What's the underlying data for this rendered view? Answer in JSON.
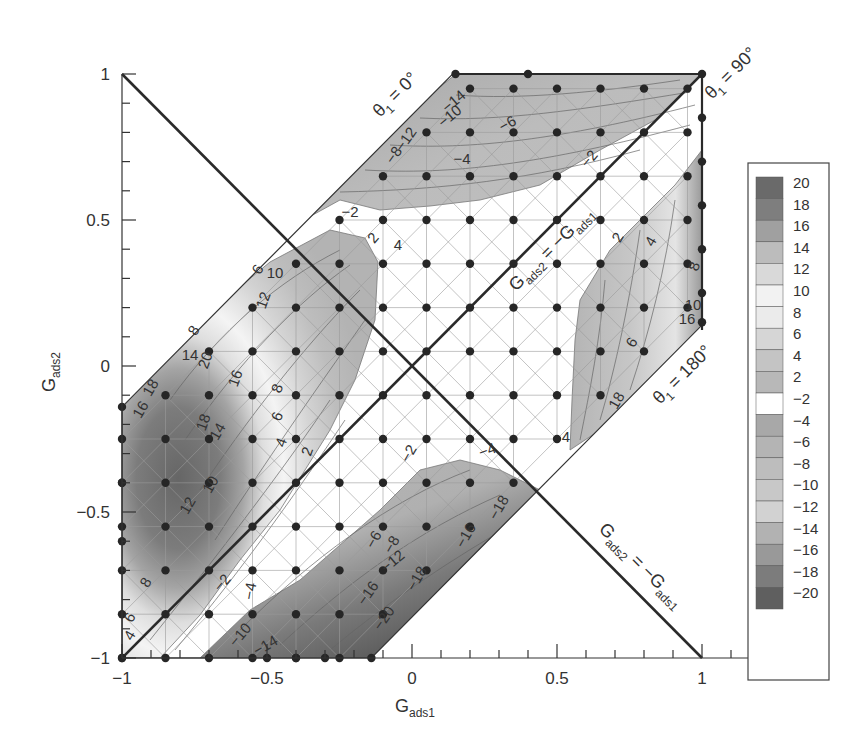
{
  "chart_data": {
    "type": "heatmap",
    "subtype": "filled-contour over triangulated mesh",
    "title": "",
    "xlabel": "G_ads1",
    "ylabel": "G_ads2",
    "xlim": [
      -1,
      1.23
    ],
    "ylim": [
      -1,
      1
    ],
    "xticks": [
      -1,
      -0.5,
      0,
      0.5,
      1
    ],
    "xtick_labels": [
      "−1",
      "−0.5",
      "0",
      "0.5",
      "1"
    ],
    "yticks": [
      -1,
      -0.5,
      0,
      0.5,
      1
    ],
    "ytick_labels": [
      "−1",
      "−0.5",
      "0",
      "0.5",
      "1"
    ],
    "minor_tick_step": 0.1,
    "grid": false,
    "domain_region": {
      "description": "hexagonal band between lines G_ads2 = G_ads1 + 0.86 and G_ads2 = G_ads1 − 0.86 inside the unit box",
      "vertices": [
        [
          -1,
          -1
        ],
        [
          -0.14,
          -1
        ],
        [
          1,
          0.14
        ],
        [
          1,
          1
        ],
        [
          0.14,
          1
        ],
        [
          -1,
          -0.14
        ]
      ]
    },
    "reference_lines": [
      {
        "label": "G_ads2 = −G_ads1",
        "from": [
          -1,
          1
        ],
        "to": [
          1,
          -1
        ],
        "label_pos": "lower-right"
      },
      {
        "label": "G_ads2 = −G_ads1",
        "from": [
          -1,
          -1
        ],
        "to": [
          1,
          1
        ],
        "label_pos": "center-right"
      }
    ],
    "boundary_labels": [
      {
        "text": "θ1 = 0°",
        "edge": "upper-left diagonal"
      },
      {
        "text": "θ1 = 90°",
        "edge": "top-right corner"
      },
      {
        "text": "θ1 = 180°",
        "edge": "lower-right diagonal"
      }
    ],
    "colorbar": {
      "position": "right",
      "levels": [
        20,
        18,
        16,
        14,
        12,
        10,
        8,
        6,
        4,
        2,
        -2,
        -4,
        -6,
        -8,
        -10,
        -12,
        -14,
        -16,
        -18,
        -20
      ],
      "labels": [
        "20",
        "18",
        "16",
        "14",
        "12",
        "10",
        "8",
        "6",
        "4",
        "2",
        "−2",
        "−4",
        "−6",
        "−8",
        "−10",
        "−12",
        "−14",
        "−16",
        "−18",
        "−20"
      ],
      "colors": [
        "#6a6a6a",
        "#7e7e7e",
        "#a0a0a0",
        "#bcbcbc",
        "#d9d9d9",
        "#f2f2f2",
        "#ebebeb",
        "#d6d6d6",
        "#c4c4c4",
        "#b8b8b8",
        "#ffffff",
        "#a8a8a8",
        "#b4b4b4",
        "#bdbdbd",
        "#c8c8c8",
        "#d2d2d2",
        "#b2b2b2",
        "#999999",
        "#7c7c7c",
        "#5f5f5f"
      ]
    },
    "regions": [
      {
        "name": "upper negative lobe",
        "range": [
          -14,
          -2
        ],
        "contour_labels": [
          "-14",
          "-10",
          "-12",
          "-8",
          "-6",
          "-4",
          "-2"
        ]
      },
      {
        "name": "left positive lobe",
        "range": [
          2,
          20
        ],
        "contour_labels": [
          "4",
          "6",
          "10",
          "12",
          "8",
          "14",
          "20",
          "18",
          "16",
          "18",
          "14",
          "12",
          "10",
          "8",
          "6",
          "4",
          "2"
        ]
      },
      {
        "name": "right positive lobe",
        "range": [
          2,
          16
        ],
        "contour_labels": [
          "2",
          "4",
          "8",
          "10",
          "16",
          "6",
          "18",
          "4"
        ]
      },
      {
        "name": "lower negative lobe",
        "range": [
          -20,
          -2
        ],
        "contour_labels": [
          "-2",
          "-4",
          "-6",
          "-8",
          "-12",
          "-16",
          "-18",
          "-20",
          "-10",
          "-14"
        ]
      },
      {
        "name": "central neutral band",
        "range": [
          -2,
          2
        ]
      }
    ],
    "sample_points_grid_step": 0.15
  },
  "axes": {
    "xlabel_main": "G",
    "xlabel_sub": "ads1",
    "ylabel_main": "G",
    "ylabel_sub": "ads2"
  },
  "annotations": {
    "theta0": {
      "main": "θ",
      "sub": "1",
      "rest": " = 0°"
    },
    "theta90": {
      "main": "θ",
      "sub": "1",
      "rest": " = 90°"
    },
    "theta180": {
      "main": "θ",
      "sub": "1",
      "rest": " = 180°"
    },
    "diag_center": {
      "g1": "G",
      "s1": "ads2",
      "eq": " = −G",
      "s2": "ads1"
    },
    "diag_lower": {
      "g1": "G",
      "s1": "ads2",
      "eq": " = −G",
      "s2": "ads1"
    }
  },
  "contour_text": {
    "upper": [
      {
        "t": "-14",
        "x": 457,
        "y": 105,
        "r": -40
      },
      {
        "t": "-10",
        "x": 453,
        "y": 120,
        "r": -40
      },
      {
        "t": "-12",
        "x": 410,
        "y": 142,
        "r": -55
      },
      {
        "t": "-8",
        "x": 398,
        "y": 158,
        "r": -55
      },
      {
        "t": "-6",
        "x": 510,
        "y": 128,
        "r": -30
      },
      {
        "t": "-4",
        "x": 462,
        "y": 164,
        "r": 0
      },
      {
        "t": "-2",
        "x": 593,
        "y": 162,
        "r": -50
      },
      {
        "t": "-2",
        "x": 350,
        "y": 217,
        "r": 0
      },
      {
        "t": "4",
        "x": 398,
        "y": 250,
        "r": 0
      },
      {
        "t": "2",
        "x": 377,
        "y": 241,
        "r": -50
      }
    ],
    "left": [
      {
        "t": "6",
        "x": 262,
        "y": 272,
        "r": -60
      },
      {
        "t": "10",
        "x": 275,
        "y": 278,
        "r": 0
      },
      {
        "t": "12",
        "x": 268,
        "y": 302,
        "r": -70
      },
      {
        "t": "8",
        "x": 198,
        "y": 333,
        "r": -60
      },
      {
        "t": "14",
        "x": 190,
        "y": 360,
        "r": 0
      },
      {
        "t": "20",
        "x": 210,
        "y": 362,
        "r": -70
      },
      {
        "t": "16",
        "x": 240,
        "y": 380,
        "r": -70
      },
      {
        "t": "18",
        "x": 155,
        "y": 390,
        "r": -60
      },
      {
        "t": "16",
        "x": 145,
        "y": 412,
        "r": -60
      },
      {
        "t": "18",
        "x": 208,
        "y": 424,
        "r": -70
      },
      {
        "t": "14",
        "x": 222,
        "y": 434,
        "r": -60
      },
      {
        "t": "8",
        "x": 282,
        "y": 390,
        "r": -70
      },
      {
        "t": "6",
        "x": 282,
        "y": 418,
        "r": -70
      },
      {
        "t": "4",
        "x": 286,
        "y": 444,
        "r": -70
      },
      {
        "t": "2",
        "x": 312,
        "y": 453,
        "r": -70
      },
      {
        "t": "12",
        "x": 192,
        "y": 508,
        "r": -60
      },
      {
        "t": "10",
        "x": 215,
        "y": 487,
        "r": -60
      },
      {
        "t": "8",
        "x": 150,
        "y": 585,
        "r": -60
      },
      {
        "t": "6",
        "x": 134,
        "y": 620,
        "r": -60
      },
      {
        "t": "4",
        "x": 134,
        "y": 638,
        "r": -60
      }
    ],
    "right": [
      {
        "t": "2",
        "x": 622,
        "y": 240,
        "r": -60
      },
      {
        "t": "4",
        "x": 655,
        "y": 244,
        "r": -60
      },
      {
        "t": "8",
        "x": 699,
        "y": 268,
        "r": -70
      },
      {
        "t": "10",
        "x": 693,
        "y": 310,
        "r": 0
      },
      {
        "t": "16",
        "x": 687,
        "y": 324,
        "r": 0
      },
      {
        "t": "6",
        "x": 636,
        "y": 345,
        "r": -60
      },
      {
        "t": "18",
        "x": 621,
        "y": 403,
        "r": -60
      },
      {
        "t": "4",
        "x": 566,
        "y": 442,
        "r": 0
      }
    ],
    "lower": [
      {
        "t": "-2",
        "x": 226,
        "y": 586,
        "r": -50
      },
      {
        "t": "-4",
        "x": 255,
        "y": 592,
        "r": -80
      },
      {
        "t": "-2",
        "x": 413,
        "y": 456,
        "r": -60
      },
      {
        "t": "-4",
        "x": 489,
        "y": 455,
        "r": -20
      },
      {
        "t": "-6",
        "x": 378,
        "y": 542,
        "r": -60
      },
      {
        "t": "-8",
        "x": 396,
        "y": 547,
        "r": -60
      },
      {
        "t": "-12",
        "x": 396,
        "y": 565,
        "r": -40
      },
      {
        "t": "-16",
        "x": 372,
        "y": 596,
        "r": -55
      },
      {
        "t": "-18",
        "x": 421,
        "y": 581,
        "r": -60
      },
      {
        "t": "-20",
        "x": 388,
        "y": 621,
        "r": -55
      },
      {
        "t": "-10",
        "x": 244,
        "y": 638,
        "r": -50
      },
      {
        "t": "-14",
        "x": 268,
        "y": 650,
        "r": -30
      },
      {
        "t": "-16",
        "x": 470,
        "y": 538,
        "r": -60
      },
      {
        "t": "-18",
        "x": 503,
        "y": 510,
        "r": -60
      }
    ]
  }
}
